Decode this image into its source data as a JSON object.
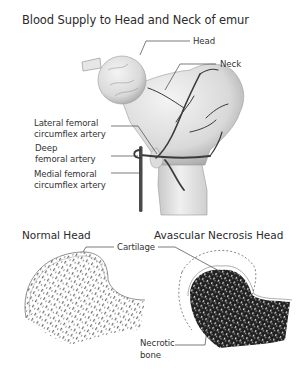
{
  "title": "Blood Supply to Head and Neck of emur",
  "top_diagram": {
    "labels": {
      "head": "Head",
      "neck": "Neck",
      "lateral_line1": "Lateral femoral",
      "lateral_line2": "circumflex artery",
      "deep_line1": "Deep",
      "deep_line2": "femoral artery",
      "medial_line1": "Medial femoral",
      "medial_line2": "circumflex artery"
    }
  },
  "bottom_diagram": {
    "normal_title": "Normal Head",
    "avn_title": "Avascular Necrosis Head",
    "cartilage_label": "Cartilage",
    "necrotic_line1": "Necrotic",
    "necrotic_line2": "bone"
  }
}
